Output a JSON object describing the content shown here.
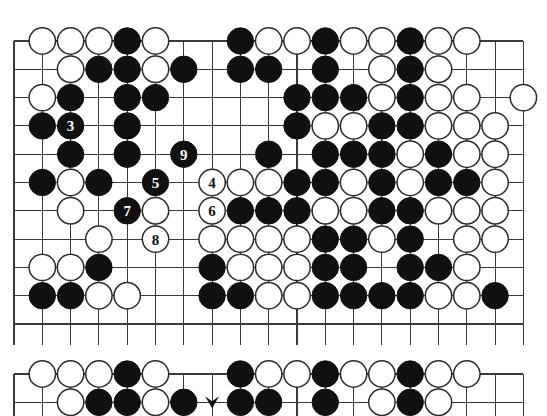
{
  "colors": {
    "black_stone": "#101010",
    "white_stone": "#ffffff",
    "stone_outline": "#2b2b2b",
    "grid_line": "#3a3a3a",
    "board_background": "#ffffff",
    "label_on_black": "#ffffff",
    "label_on_white": "#101010"
  },
  "board_top": {
    "name": "upper-diagram",
    "geometry": {
      "origin_x": 14,
      "origin_y": 41,
      "spacing": 28.3,
      "cols": 19,
      "rows": 11,
      "stone_radius": 13.2
    },
    "move_labels": [
      "3",
      "4",
      "5",
      "6",
      "7",
      "8",
      "9"
    ],
    "stones": [
      {
        "c": 1,
        "r": 0,
        "color": "white"
      },
      {
        "c": 2,
        "r": 0,
        "color": "white"
      },
      {
        "c": 3,
        "r": 0,
        "color": "white"
      },
      {
        "c": 4,
        "r": 0,
        "color": "black"
      },
      {
        "c": 5,
        "r": 0,
        "color": "white"
      },
      {
        "c": 8,
        "r": 0,
        "color": "black"
      },
      {
        "c": 9,
        "r": 0,
        "color": "white"
      },
      {
        "c": 10,
        "r": 0,
        "color": "white"
      },
      {
        "c": 11,
        "r": 0,
        "color": "black"
      },
      {
        "c": 12,
        "r": 0,
        "color": "white"
      },
      {
        "c": 13,
        "r": 0,
        "color": "white"
      },
      {
        "c": 14,
        "r": 0,
        "color": "black"
      },
      {
        "c": 15,
        "r": 0,
        "color": "white"
      },
      {
        "c": 16,
        "r": 0,
        "color": "white"
      },
      {
        "c": 2,
        "r": 1,
        "color": "white"
      },
      {
        "c": 3,
        "r": 1,
        "color": "black"
      },
      {
        "c": 4,
        "r": 1,
        "color": "black"
      },
      {
        "c": 5,
        "r": 1,
        "color": "white"
      },
      {
        "c": 6,
        "r": 1,
        "color": "black"
      },
      {
        "c": 8,
        "r": 1,
        "color": "black"
      },
      {
        "c": 9,
        "r": 1,
        "color": "black"
      },
      {
        "c": 11,
        "r": 1,
        "color": "black"
      },
      {
        "c": 13,
        "r": 1,
        "color": "white"
      },
      {
        "c": 14,
        "r": 1,
        "color": "black"
      },
      {
        "c": 15,
        "r": 1,
        "color": "white"
      },
      {
        "c": 1,
        "r": 2,
        "color": "white"
      },
      {
        "c": 2,
        "r": 2,
        "color": "black"
      },
      {
        "c": 4,
        "r": 2,
        "color": "black"
      },
      {
        "c": 5,
        "r": 2,
        "color": "black"
      },
      {
        "c": 10,
        "r": 2,
        "color": "black"
      },
      {
        "c": 11,
        "r": 2,
        "color": "black"
      },
      {
        "c": 12,
        "r": 2,
        "color": "black"
      },
      {
        "c": 13,
        "r": 2,
        "color": "white"
      },
      {
        "c": 14,
        "r": 2,
        "color": "black"
      },
      {
        "c": 15,
        "r": 2,
        "color": "white"
      },
      {
        "c": 16,
        "r": 2,
        "color": "white"
      },
      {
        "c": 18,
        "r": 2,
        "color": "white"
      },
      {
        "c": 1,
        "r": 3,
        "color": "black"
      },
      {
        "c": 2,
        "r": 3,
        "color": "black",
        "label": "3"
      },
      {
        "c": 4,
        "r": 3,
        "color": "black"
      },
      {
        "c": 10,
        "r": 3,
        "color": "black"
      },
      {
        "c": 11,
        "r": 3,
        "color": "white"
      },
      {
        "c": 12,
        "r": 3,
        "color": "white"
      },
      {
        "c": 13,
        "r": 3,
        "color": "black"
      },
      {
        "c": 14,
        "r": 3,
        "color": "black"
      },
      {
        "c": 15,
        "r": 3,
        "color": "white"
      },
      {
        "c": 16,
        "r": 3,
        "color": "white"
      },
      {
        "c": 17,
        "r": 3,
        "color": "white"
      },
      {
        "c": 2,
        "r": 4,
        "color": "black"
      },
      {
        "c": 4,
        "r": 4,
        "color": "black"
      },
      {
        "c": 6,
        "r": 4,
        "color": "black",
        "label": "9"
      },
      {
        "c": 9,
        "r": 4,
        "color": "black"
      },
      {
        "c": 11,
        "r": 4,
        "color": "black"
      },
      {
        "c": 12,
        "r": 4,
        "color": "black"
      },
      {
        "c": 13,
        "r": 4,
        "color": "black"
      },
      {
        "c": 14,
        "r": 4,
        "color": "white"
      },
      {
        "c": 15,
        "r": 4,
        "color": "black"
      },
      {
        "c": 16,
        "r": 4,
        "color": "white"
      },
      {
        "c": 17,
        "r": 4,
        "color": "white"
      },
      {
        "c": 1,
        "r": 5,
        "color": "black"
      },
      {
        "c": 2,
        "r": 5,
        "color": "white"
      },
      {
        "c": 3,
        "r": 5,
        "color": "black"
      },
      {
        "c": 5,
        "r": 5,
        "color": "black",
        "label": "5"
      },
      {
        "c": 7,
        "r": 5,
        "color": "white",
        "label": "4"
      },
      {
        "c": 8,
        "r": 5,
        "color": "white"
      },
      {
        "c": 9,
        "r": 5,
        "color": "white"
      },
      {
        "c": 10,
        "r": 5,
        "color": "black"
      },
      {
        "c": 11,
        "r": 5,
        "color": "black"
      },
      {
        "c": 12,
        "r": 5,
        "color": "white"
      },
      {
        "c": 13,
        "r": 5,
        "color": "black"
      },
      {
        "c": 14,
        "r": 5,
        "color": "white"
      },
      {
        "c": 15,
        "r": 5,
        "color": "black"
      },
      {
        "c": 16,
        "r": 5,
        "color": "black"
      },
      {
        "c": 17,
        "r": 5,
        "color": "white"
      },
      {
        "c": 2,
        "r": 6,
        "color": "white"
      },
      {
        "c": 4,
        "r": 6,
        "color": "black",
        "label": "7"
      },
      {
        "c": 5,
        "r": 6,
        "color": "white"
      },
      {
        "c": 7,
        "r": 6,
        "color": "white",
        "label": "6"
      },
      {
        "c": 8,
        "r": 6,
        "color": "black"
      },
      {
        "c": 9,
        "r": 6,
        "color": "black"
      },
      {
        "c": 10,
        "r": 6,
        "color": "black"
      },
      {
        "c": 11,
        "r": 6,
        "color": "white"
      },
      {
        "c": 12,
        "r": 6,
        "color": "white"
      },
      {
        "c": 13,
        "r": 6,
        "color": "black"
      },
      {
        "c": 14,
        "r": 6,
        "color": "black"
      },
      {
        "c": 15,
        "r": 6,
        "color": "white"
      },
      {
        "c": 16,
        "r": 6,
        "color": "white"
      },
      {
        "c": 17,
        "r": 6,
        "color": "white"
      },
      {
        "c": 3,
        "r": 7,
        "color": "white"
      },
      {
        "c": 5,
        "r": 7,
        "color": "white",
        "label": "8"
      },
      {
        "c": 7,
        "r": 7,
        "color": "white"
      },
      {
        "c": 8,
        "r": 7,
        "color": "white"
      },
      {
        "c": 9,
        "r": 7,
        "color": "white"
      },
      {
        "c": 10,
        "r": 7,
        "color": "white"
      },
      {
        "c": 11,
        "r": 7,
        "color": "black"
      },
      {
        "c": 12,
        "r": 7,
        "color": "black"
      },
      {
        "c": 13,
        "r": 7,
        "color": "white"
      },
      {
        "c": 14,
        "r": 7,
        "color": "black"
      },
      {
        "c": 16,
        "r": 7,
        "color": "white"
      },
      {
        "c": 17,
        "r": 7,
        "color": "white"
      },
      {
        "c": 1,
        "r": 8,
        "color": "white"
      },
      {
        "c": 2,
        "r": 8,
        "color": "white"
      },
      {
        "c": 3,
        "r": 8,
        "color": "black"
      },
      {
        "c": 7,
        "r": 8,
        "color": "black"
      },
      {
        "c": 8,
        "r": 8,
        "color": "white"
      },
      {
        "c": 9,
        "r": 8,
        "color": "white"
      },
      {
        "c": 10,
        "r": 8,
        "color": "white"
      },
      {
        "c": 11,
        "r": 8,
        "color": "black"
      },
      {
        "c": 12,
        "r": 8,
        "color": "black"
      },
      {
        "c": 14,
        "r": 8,
        "color": "black"
      },
      {
        "c": 15,
        "r": 8,
        "color": "black"
      },
      {
        "c": 16,
        "r": 8,
        "color": "white"
      },
      {
        "c": 1,
        "r": 9,
        "color": "black"
      },
      {
        "c": 2,
        "r": 9,
        "color": "black"
      },
      {
        "c": 3,
        "r": 9,
        "color": "white"
      },
      {
        "c": 4,
        "r": 9,
        "color": "white"
      },
      {
        "c": 7,
        "r": 9,
        "color": "black"
      },
      {
        "c": 8,
        "r": 9,
        "color": "black"
      },
      {
        "c": 9,
        "r": 9,
        "color": "white"
      },
      {
        "c": 10,
        "r": 9,
        "color": "white"
      },
      {
        "c": 11,
        "r": 9,
        "color": "black"
      },
      {
        "c": 12,
        "r": 9,
        "color": "black"
      },
      {
        "c": 13,
        "r": 9,
        "color": "black"
      },
      {
        "c": 14,
        "r": 9,
        "color": "black"
      },
      {
        "c": 15,
        "r": 9,
        "color": "white"
      },
      {
        "c": 16,
        "r": 9,
        "color": "white"
      },
      {
        "c": 17,
        "r": 9,
        "color": "black"
      }
    ]
  },
  "board_bottom": {
    "name": "lower-diagram",
    "geometry": {
      "origin_x": 14,
      "origin_y": 22,
      "spacing": 28.3,
      "cols": 19,
      "rows": 2,
      "stone_radius": 13.2
    },
    "stones": [
      {
        "c": 1,
        "r": 0,
        "color": "white"
      },
      {
        "c": 2,
        "r": 0,
        "color": "white"
      },
      {
        "c": 3,
        "r": 0,
        "color": "white"
      },
      {
        "c": 4,
        "r": 0,
        "color": "black"
      },
      {
        "c": 5,
        "r": 0,
        "color": "white"
      },
      {
        "c": 8,
        "r": 0,
        "color": "black"
      },
      {
        "c": 9,
        "r": 0,
        "color": "white"
      },
      {
        "c": 10,
        "r": 0,
        "color": "white"
      },
      {
        "c": 11,
        "r": 0,
        "color": "black"
      },
      {
        "c": 12,
        "r": 0,
        "color": "white"
      },
      {
        "c": 13,
        "r": 0,
        "color": "white"
      },
      {
        "c": 14,
        "r": 0,
        "color": "black"
      },
      {
        "c": 15,
        "r": 0,
        "color": "white"
      },
      {
        "c": 16,
        "r": 0,
        "color": "white"
      },
      {
        "c": 2,
        "r": 1,
        "color": "white"
      },
      {
        "c": 3,
        "r": 1,
        "color": "black"
      },
      {
        "c": 4,
        "r": 1,
        "color": "black"
      },
      {
        "c": 5,
        "r": 1,
        "color": "white"
      },
      {
        "c": 6,
        "r": 1,
        "color": "black"
      },
      {
        "c": 8,
        "r": 1,
        "color": "black"
      },
      {
        "c": 9,
        "r": 1,
        "color": "black"
      },
      {
        "c": 11,
        "r": 1,
        "color": "black"
      },
      {
        "c": 13,
        "r": 1,
        "color": "white"
      },
      {
        "c": 14,
        "r": 1,
        "color": "black"
      },
      {
        "c": 15,
        "r": 1,
        "color": "white"
      }
    ],
    "marks": [
      {
        "c": 7,
        "r": 1,
        "type": "arrow-marker"
      }
    ]
  }
}
